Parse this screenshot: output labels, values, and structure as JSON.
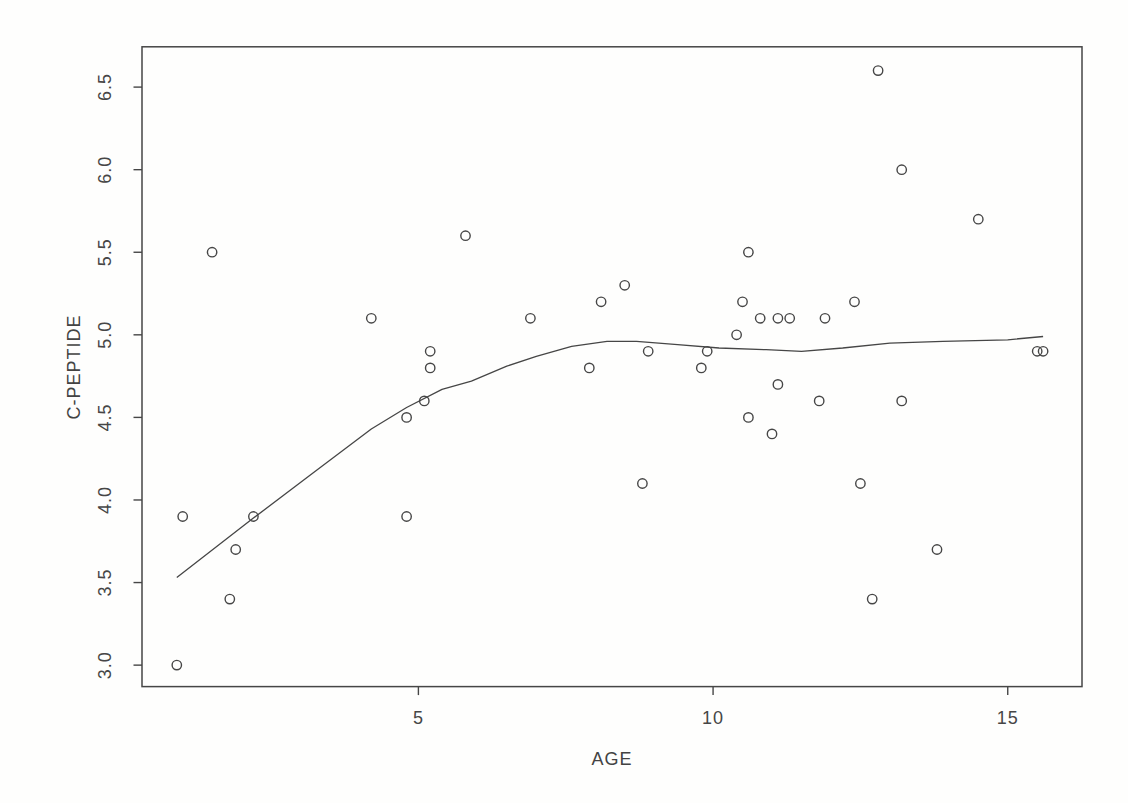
{
  "page": {
    "background": "#fefefd",
    "ink_color": "#464646"
  },
  "chart_data": {
    "type": "scatter",
    "title": "",
    "xlabel": "AGE",
    "ylabel": "C-PEPTIDE",
    "xlim": [
      0.31,
      16.26
    ],
    "ylim": [
      2.87,
      6.744
    ],
    "grid": false,
    "legend_position": "none",
    "marker": "open-circle",
    "x_ticks": {
      "values": [
        5,
        10,
        15
      ],
      "labels": [
        "5",
        "10",
        "15"
      ]
    },
    "y_ticks": {
      "values": [
        3.0,
        3.5,
        4.0,
        4.5,
        5.0,
        5.5,
        6.0,
        6.5
      ],
      "labels": [
        "3.0",
        "3.5",
        "4.0",
        "4.5",
        "5.0",
        "5.5",
        "6.0",
        "6.5"
      ]
    },
    "points": [
      [
        0.9,
        3.0
      ],
      [
        1.0,
        3.9
      ],
      [
        1.5,
        5.5
      ],
      [
        1.8,
        3.4
      ],
      [
        1.9,
        3.7
      ],
      [
        2.2,
        3.9
      ],
      [
        4.2,
        5.1
      ],
      [
        4.8,
        3.9
      ],
      [
        4.8,
        4.5
      ],
      [
        5.1,
        4.6
      ],
      [
        5.2,
        4.8
      ],
      [
        5.2,
        4.9
      ],
      [
        5.8,
        5.6
      ],
      [
        6.9,
        5.1
      ],
      [
        7.9,
        4.8
      ],
      [
        8.1,
        5.2
      ],
      [
        8.5,
        5.3
      ],
      [
        8.8,
        4.1
      ],
      [
        8.9,
        4.9
      ],
      [
        9.8,
        4.8
      ],
      [
        9.9,
        4.9
      ],
      [
        10.4,
        5.0
      ],
      [
        10.5,
        5.2
      ],
      [
        10.6,
        4.5
      ],
      [
        10.6,
        5.5
      ],
      [
        10.8,
        5.1
      ],
      [
        11.0,
        4.4
      ],
      [
        11.1,
        4.7
      ],
      [
        11.1,
        5.1
      ],
      [
        11.3,
        5.1
      ],
      [
        11.8,
        4.6
      ],
      [
        11.9,
        5.1
      ],
      [
        12.4,
        5.2
      ],
      [
        12.5,
        4.1
      ],
      [
        12.7,
        3.4
      ],
      [
        12.8,
        6.6
      ],
      [
        13.2,
        4.6
      ],
      [
        13.2,
        6.0
      ],
      [
        13.8,
        3.7
      ],
      [
        14.5,
        5.7
      ],
      [
        15.5,
        4.9
      ],
      [
        15.6,
        4.9
      ]
    ],
    "smooth_line": [
      [
        0.9,
        3.53
      ],
      [
        2.2,
        3.89
      ],
      [
        3.2,
        4.16
      ],
      [
        4.2,
        4.43
      ],
      [
        4.8,
        4.56
      ],
      [
        5.4,
        4.67
      ],
      [
        5.9,
        4.72
      ],
      [
        6.5,
        4.81
      ],
      [
        7.0,
        4.87
      ],
      [
        7.6,
        4.93
      ],
      [
        8.2,
        4.96
      ],
      [
        8.7,
        4.96
      ],
      [
        9.4,
        4.94
      ],
      [
        10.1,
        4.92
      ],
      [
        10.9,
        4.91
      ],
      [
        11.5,
        4.9
      ],
      [
        12.2,
        4.92
      ],
      [
        13.0,
        4.95
      ],
      [
        13.9,
        4.96
      ],
      [
        15.0,
        4.97
      ],
      [
        15.6,
        4.99
      ]
    ]
  }
}
